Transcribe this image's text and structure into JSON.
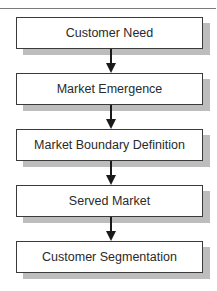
{
  "diagram": {
    "type": "flowchart",
    "direction": "top-to-bottom",
    "steps": [
      {
        "label": "Customer Need"
      },
      {
        "label": "Market Emergence"
      },
      {
        "label": "Market Boundary Definition"
      },
      {
        "label": "Served Market"
      },
      {
        "label": "Customer Segmentation"
      }
    ],
    "connectors": [
      {
        "from": 0,
        "to": 1
      },
      {
        "from": 1,
        "to": 2
      },
      {
        "from": 2,
        "to": 3
      },
      {
        "from": 3,
        "to": 4
      }
    ],
    "colors": {
      "box_border": "#3a3a3a",
      "box_fill": "#ffffff",
      "shadow": "#bdbdbd",
      "arrow": "#1a1a1a",
      "text": "#2a2a2a"
    }
  }
}
